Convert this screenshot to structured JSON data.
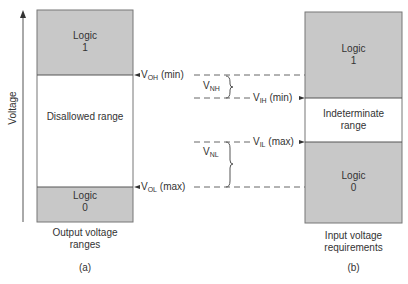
{
  "axis": {
    "label": "Voltage"
  },
  "left_panel": {
    "logic1": {
      "line1": "Logic",
      "line2": "1"
    },
    "disallowed": "Disallowed range",
    "logic0": {
      "line1": "Logic",
      "line2": "0"
    },
    "caption_line1": "Output voltage",
    "caption_line2": "ranges",
    "tag": "(a)"
  },
  "right_panel": {
    "logic1": {
      "line1": "Logic",
      "line2": "1"
    },
    "indeterminate_line1": "Indeterminate",
    "indeterminate_line2": "range",
    "logic0": {
      "line1": "Logic",
      "line2": "0"
    },
    "caption_line1": "Input voltage",
    "caption_line2": "requirements",
    "tag": "(b)"
  },
  "levels": {
    "voh": {
      "base": "V",
      "sub": "OH",
      "suffix": "(min)"
    },
    "vol": {
      "base": "V",
      "sub": "OL",
      "suffix": "(max)"
    },
    "vih": {
      "base": "V",
      "sub": "IH",
      "suffix": "(min)"
    },
    "vil": {
      "base": "V",
      "sub": "IL",
      "suffix": "(max)"
    },
    "vnh": {
      "base": "V",
      "sub": "NH"
    },
    "vnl": {
      "base": "V",
      "sub": "NL"
    }
  },
  "colors": {
    "logic_fill": "#c8c8c8",
    "line": "#555555",
    "text": "#333333"
  }
}
